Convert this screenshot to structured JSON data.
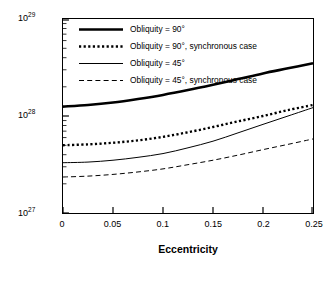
{
  "chart_data": {
    "type": "line",
    "title": "",
    "xlabel": "Eccentricity",
    "ylabel": "Rate of Tidal Dissipation (erg/s)",
    "xlim": [
      0,
      0.25
    ],
    "ylim": [
      1e+27,
      1e+29
    ],
    "yscale": "log",
    "xticks": [
      0,
      0.05,
      0.1,
      0.15,
      0.2,
      0.25
    ],
    "xticklabels": [
      "0",
      "0.05",
      "0.1",
      "0.15",
      "0.2",
      "0.25"
    ],
    "yticks": [
      1e+27,
      1e+28,
      1e+29
    ],
    "yticklabels": [
      "10",
      "10",
      "10"
    ],
    "yticklabel_exponents": [
      "27",
      "28",
      "29"
    ],
    "grid": false,
    "legend_position": "upper left",
    "series": [
      {
        "name": "Obliquity = 90°",
        "style": "solid-thick",
        "x": [
          0,
          0.025,
          0.05,
          0.075,
          0.1,
          0.125,
          0.15,
          0.175,
          0.2,
          0.225,
          0.25
        ],
        "y": [
          1.25e+28,
          1.3e+28,
          1.38e+28,
          1.5e+28,
          1.65e+28,
          1.85e+28,
          2.1e+28,
          2.4e+28,
          2.75e+28,
          3.1e+28,
          3.5e+28
        ]
      },
      {
        "name": "Obliquity = 90°, synchronous case",
        "style": "dotted-thick",
        "x": [
          0,
          0.025,
          0.05,
          0.075,
          0.1,
          0.125,
          0.15,
          0.175,
          0.2,
          0.225,
          0.25
        ],
        "y": [
          5e+27,
          5.1e+27,
          5.3e+27,
          5.6e+27,
          6.1e+27,
          6.8e+27,
          7.7e+27,
          8.8e+27,
          1e+28,
          1.15e+28,
          1.3e+28
        ]
      },
      {
        "name": "Obliquity = 45°",
        "style": "solid-thin",
        "x": [
          0,
          0.025,
          0.05,
          0.075,
          0.1,
          0.125,
          0.15,
          0.175,
          0.2,
          0.225,
          0.25
        ],
        "y": [
          3.3e+27,
          3.35e+27,
          3.5e+27,
          3.75e+27,
          4.1e+27,
          4.7e+27,
          5.5e+27,
          6.7e+27,
          8.2e+27,
          1e+28,
          1.22e+28
        ]
      },
      {
        "name": "Obliquity = 45°, synchronous case",
        "style": "dashed-thin",
        "x": [
          0,
          0.025,
          0.05,
          0.075,
          0.1,
          0.125,
          0.15,
          0.175,
          0.2,
          0.225,
          0.25
        ],
        "y": [
          2.35e+27,
          2.4e+27,
          2.5e+27,
          2.65e+27,
          2.85e+27,
          3.15e+27,
          3.5e+27,
          3.95e+27,
          4.5e+27,
          5.1e+27,
          5.8e+27
        ]
      }
    ],
    "legend": [
      "Obliquity = 90°",
      "Obliquity = 90°, synchronous case",
      "Obliquity = 45°",
      "Obliquity = 45°, synchronous case"
    ]
  }
}
